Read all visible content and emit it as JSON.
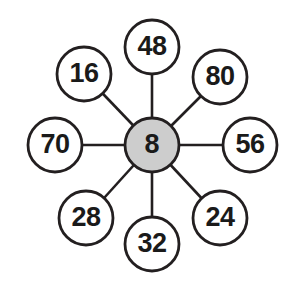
{
  "diagram": {
    "type": "multiplication-wheel",
    "center": {
      "label": "8",
      "cx": 152,
      "cy": 145,
      "r": 27,
      "fill": "#cdcdcd",
      "stroke": "#231f20"
    },
    "nodes": [
      {
        "label": "48",
        "position": "top",
        "cx": 152,
        "cy": 47,
        "r": 27,
        "fill": "#ffffff",
        "stroke": "#231f20"
      },
      {
        "label": "80",
        "position": "upper-right",
        "cx": 220,
        "cy": 77,
        "r": 27,
        "fill": "#ffffff",
        "stroke": "#231f20"
      },
      {
        "label": "56",
        "position": "right",
        "cx": 250,
        "cy": 145,
        "r": 27,
        "fill": "#ffffff",
        "stroke": "#231f20"
      },
      {
        "label": "24",
        "position": "lower-right",
        "cx": 220,
        "cy": 218,
        "r": 27,
        "fill": "#ffffff",
        "stroke": "#231f20"
      },
      {
        "label": "32",
        "position": "bottom",
        "cx": 152,
        "cy": 244,
        "r": 27,
        "fill": "#ffffff",
        "stroke": "#231f20"
      },
      {
        "label": "28",
        "position": "lower-left",
        "cx": 86,
        "cy": 218,
        "r": 27,
        "fill": "#ffffff",
        "stroke": "#231f20"
      },
      {
        "label": "70",
        "position": "left",
        "cx": 55,
        "cy": 145,
        "r": 27,
        "fill": "#ffffff",
        "stroke": "#231f20"
      },
      {
        "label": "16",
        "position": "upper-left",
        "cx": 84,
        "cy": 74,
        "r": 27,
        "fill": "#ffffff",
        "stroke": "#231f20"
      }
    ],
    "colors": {
      "line": "#231f20",
      "center_fill": "#cdcdcd",
      "node_fill": "#ffffff",
      "text": "#1a1a1a",
      "background": "#ffffff"
    }
  }
}
